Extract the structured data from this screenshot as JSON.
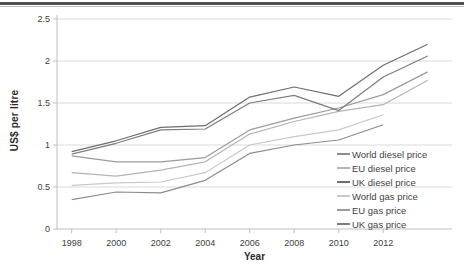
{
  "axes": {
    "y_title": "US$ per litre",
    "x_title": "Year"
  },
  "colors": {
    "gridline": "#dadada",
    "axis": "#bfbfbf",
    "tick_label": "#404040",
    "top_rule_dark": "#4f4f4f",
    "top_rule_light": "#bdbdbd"
  },
  "chart_data": {
    "type": "line",
    "title": "",
    "xlabel": "Year",
    "ylabel": "US$ per litre",
    "grid": true,
    "legend_position": "inside-right-bottom",
    "ylim": [
      0,
      2.5
    ],
    "y_ticks": [
      0,
      0.5,
      1,
      1.5,
      2,
      2.5
    ],
    "y_tick_labels": [
      "0",
      "0.5",
      "1",
      "1.5",
      "2",
      "2.5"
    ],
    "x_tick_labels": [
      "1998",
      "2000",
      "2002",
      "2004",
      "2006",
      "2008",
      "2010",
      "2012"
    ],
    "x": [
      1998,
      2000,
      2002,
      2004,
      2006,
      2008,
      2010,
      2012,
      2014
    ],
    "series": [
      {
        "name": "World diesel price",
        "color": "#8c8c8c",
        "values": [
          0.35,
          0.44,
          0.43,
          0.58,
          0.9,
          1.0,
          1.06,
          1.24,
          null
        ]
      },
      {
        "name": "EU diesel price",
        "color": "#b4b4b4",
        "values": [
          0.67,
          0.63,
          0.7,
          0.8,
          1.13,
          1.28,
          1.4,
          1.48,
          1.77
        ]
      },
      {
        "name": "UK diesel price",
        "color": "#6e6e6e",
        "values": [
          0.92,
          1.05,
          1.21,
          1.23,
          1.57,
          1.69,
          1.58,
          1.95,
          2.2
        ]
      },
      {
        "name": "World gas price",
        "color": "#c9c9c9",
        "values": [
          0.52,
          0.55,
          0.56,
          0.67,
          1.0,
          1.1,
          1.18,
          1.36,
          null
        ]
      },
      {
        "name": "EU gas price",
        "color": "#9b9b9b",
        "values": [
          0.87,
          0.8,
          0.8,
          0.85,
          1.18,
          1.32,
          1.44,
          1.6,
          1.87
        ]
      },
      {
        "name": "UK gas price",
        "color": "#7d7d7d",
        "values": [
          0.89,
          1.02,
          1.18,
          1.19,
          1.5,
          1.59,
          1.41,
          1.81,
          2.06
        ]
      }
    ]
  }
}
